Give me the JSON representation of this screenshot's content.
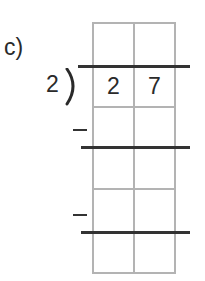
{
  "problem": {
    "label": "c)",
    "divisor": "2",
    "dividend_digits": [
      "2",
      "7"
    ],
    "quotient_digits": [
      "",
      ""
    ],
    "work_rows": [
      {
        "sign": "−",
        "digits": [
          "",
          ""
        ]
      },
      {
        "sign": "",
        "digits": [
          "",
          ""
        ]
      },
      {
        "sign": "−",
        "digits": [
          "",
          ""
        ]
      },
      {
        "sign": "",
        "digits": [
          "",
          ""
        ]
      }
    ]
  },
  "colors": {
    "grid": "#b3b3b3",
    "rule": "#333333",
    "text": "#2a2a2a"
  }
}
